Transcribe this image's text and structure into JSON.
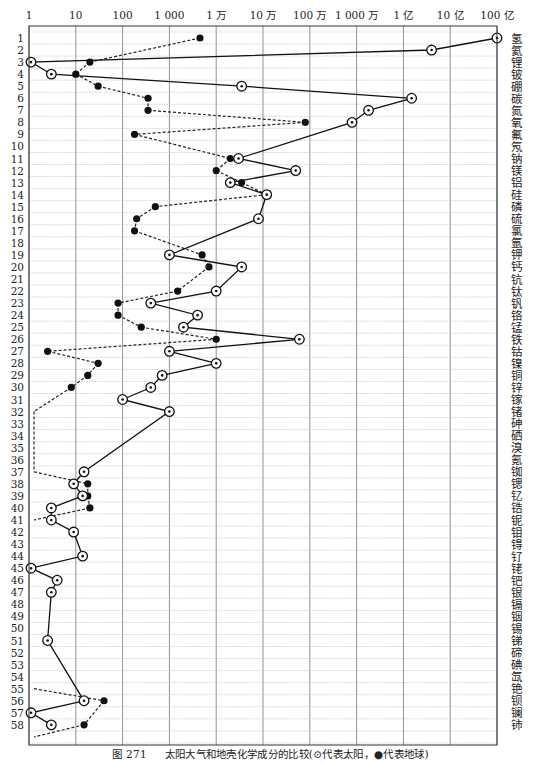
{
  "caption": {
    "figure_number": "图 271",
    "text": "太阳大气和地壳化学成分的比较(⊙代表太阳，●代表地球)"
  },
  "chart_data": {
    "type": "line",
    "title": "太阳大气和地壳化学成分的比较",
    "orientation": "horizontal",
    "xscale": "log",
    "xlim": [
      1,
      10000000000
    ],
    "x_tick_values": [
      1,
      10,
      100,
      1000,
      10000,
      100000,
      1000000,
      10000000,
      100000000,
      1000000000,
      10000000000
    ],
    "x_tick_labels": [
      "1",
      "10",
      "100",
      "1 000",
      "1 万",
      "10 万",
      "100 万",
      "1 000 万",
      "1 亿",
      "10 亿",
      "100 亿"
    ],
    "y_tick_labels": [
      "1",
      "2",
      "3",
      "4",
      "5",
      "6",
      "7",
      "8",
      "9",
      "10",
      "11",
      "12",
      "13",
      "14",
      "15",
      "16",
      "17",
      "18",
      "19",
      "20",
      "21",
      "22",
      "23",
      "24",
      "25",
      "26",
      "27",
      "28",
      "29",
      "30",
      "31",
      "32",
      "33",
      "34",
      "35",
      "36",
      "37",
      "38",
      "39",
      "40",
      "41",
      "42",
      "43",
      "44",
      "45",
      "46",
      "47",
      "48",
      "49",
      "50",
      "51",
      "52",
      "53",
      "54",
      "55",
      "56",
      "57",
      "58"
    ],
    "element_labels": [
      "氢",
      "氦",
      "锂",
      "铍",
      "硼",
      "碳",
      "氮",
      "氧",
      "氟",
      "氖",
      "钠",
      "镁",
      "铝",
      "硅",
      "磷",
      "硫",
      "氯",
      "氩",
      "钾",
      "钙",
      "钪",
      "钛",
      "钒",
      "铬",
      "锰",
      "铁",
      "钴",
      "镍",
      "铜",
      "锌",
      "镓",
      "锗",
      "砷",
      "硒",
      "溴",
      "氪",
      "铷",
      "锶",
      "钇",
      "锆",
      "铌",
      "钼",
      "锝",
      "钌",
      "铑",
      "钯",
      "银",
      "镉",
      "铟",
      "锡",
      "锑",
      "碲",
      "碘",
      "氙",
      "铯",
      "钡",
      "镧",
      "铈"
    ],
    "grid": true,
    "legend": [
      {
        "name": "太阳",
        "marker": "circled-dot",
        "line": "solid"
      },
      {
        "name": "地球",
        "marker": "filled-circle",
        "line": "dashed"
      }
    ],
    "series": [
      {
        "name": "太阳",
        "marker": "circled-dot",
        "line": "solid",
        "points": [
          {
            "atomic_number": 1,
            "value": 10000000000
          },
          {
            "atomic_number": 2,
            "value": 400000000
          },
          {
            "atomic_number": 3,
            "value": 1
          },
          {
            "atomic_number": 4,
            "value": 3
          },
          {
            "atomic_number": 5,
            "value": 35000
          },
          {
            "atomic_number": 6,
            "value": 150000000
          },
          {
            "atomic_number": 7,
            "value": 18000000
          },
          {
            "atomic_number": 8,
            "value": 8000000
          },
          {
            "atomic_number": 11,
            "value": 30000
          },
          {
            "atomic_number": 12,
            "value": 500000
          },
          {
            "atomic_number": 13,
            "value": 20000
          },
          {
            "atomic_number": 14,
            "value": 120000
          },
          {
            "atomic_number": 16,
            "value": 80000
          },
          {
            "atomic_number": 19,
            "value": 1000
          },
          {
            "atomic_number": 20,
            "value": 35000
          },
          {
            "atomic_number": 22,
            "value": 10000
          },
          {
            "atomic_number": 23,
            "value": 400
          },
          {
            "atomic_number": 24,
            "value": 4000
          },
          {
            "atomic_number": 25,
            "value": 2000
          },
          {
            "atomic_number": 26,
            "value": 600000
          },
          {
            "atomic_number": 27,
            "value": 1000
          },
          {
            "atomic_number": 28,
            "value": 10000
          },
          {
            "atomic_number": 29,
            "value": 700
          },
          {
            "atomic_number": 30,
            "value": 400
          },
          {
            "atomic_number": 31,
            "value": 100
          },
          {
            "atomic_number": 32,
            "value": 1000
          },
          {
            "atomic_number": 37,
            "value": 15
          },
          {
            "atomic_number": 38,
            "value": 9
          },
          {
            "atomic_number": 39,
            "value": 14
          },
          {
            "atomic_number": 40,
            "value": 3
          },
          {
            "atomic_number": 41,
            "value": 3
          },
          {
            "atomic_number": 42,
            "value": 9
          },
          {
            "atomic_number": 44,
            "value": 14
          },
          {
            "atomic_number": 45,
            "value": 1
          },
          {
            "atomic_number": 46,
            "value": 4
          },
          {
            "atomic_number": 47,
            "value": 3
          },
          {
            "atomic_number": 51,
            "value": 2.5
          },
          {
            "atomic_number": 56,
            "value": 15
          },
          {
            "atomic_number": 57,
            "value": 1
          },
          {
            "atomic_number": 58,
            "value": 3
          }
        ]
      },
      {
        "name": "地球",
        "marker": "filled-circle",
        "line": "dashed",
        "points": [
          {
            "atomic_number": 1,
            "value": 4500
          },
          {
            "atomic_number": 3,
            "value": 20
          },
          {
            "atomic_number": 4,
            "value": 10
          },
          {
            "atomic_number": 5,
            "value": 30
          },
          {
            "atomic_number": 6,
            "value": 350
          },
          {
            "atomic_number": 7,
            "value": 350
          },
          {
            "atomic_number": 8,
            "value": 800000
          },
          {
            "atomic_number": 9,
            "value": 180
          },
          {
            "atomic_number": 11,
            "value": 20000
          },
          {
            "atomic_number": 12,
            "value": 10000
          },
          {
            "atomic_number": 13,
            "value": 35000
          },
          {
            "atomic_number": 14,
            "value": 120000
          },
          {
            "atomic_number": 15,
            "value": 500
          },
          {
            "atomic_number": 16,
            "value": 200
          },
          {
            "atomic_number": 17,
            "value": 180
          },
          {
            "atomic_number": 19,
            "value": 5000
          },
          {
            "atomic_number": 20,
            "value": 7000
          },
          {
            "atomic_number": 22,
            "value": 1500
          },
          {
            "atomic_number": 23,
            "value": 80
          },
          {
            "atomic_number": 24,
            "value": 80
          },
          {
            "atomic_number": 25,
            "value": 250
          },
          {
            "atomic_number": 26,
            "value": 10000
          },
          {
            "atomic_number": 27,
            "value": 2.5
          },
          {
            "atomic_number": 28,
            "value": 30
          },
          {
            "atomic_number": 29,
            "value": 18
          },
          {
            "atomic_number": 30,
            "value": 8
          },
          {
            "atomic_number": 38,
            "value": 18
          },
          {
            "atomic_number": 39,
            "value": 18
          },
          {
            "atomic_number": 40,
            "value": 20
          },
          {
            "atomic_number": 56,
            "value": 40
          },
          {
            "atomic_number": 58,
            "value": 15
          }
        ],
        "offscale_below_1": [
          32,
          37,
          41,
          55,
          59
        ]
      }
    ]
  }
}
